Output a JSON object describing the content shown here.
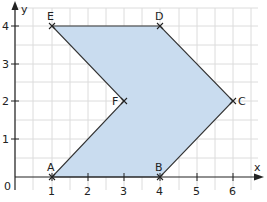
{
  "diagram": {
    "type": "coordinate-grid-polygon",
    "axes": {
      "x_label": "x",
      "y_label": "y",
      "origin_label": "0",
      "x_ticks": [
        "1",
        "2",
        "3",
        "4",
        "5",
        "6"
      ],
      "y_ticks": [
        "1",
        "2",
        "3",
        "4"
      ]
    },
    "points": [
      {
        "name": "A",
        "x": 1,
        "y": 0
      },
      {
        "name": "B",
        "x": 4,
        "y": 0
      },
      {
        "name": "C",
        "x": 6,
        "y": 2
      },
      {
        "name": "D",
        "x": 4,
        "y": 4
      },
      {
        "name": "E",
        "x": 1,
        "y": 4
      },
      {
        "name": "F",
        "x": 3,
        "y": 2
      }
    ],
    "fill_color": "#c9dcef",
    "grid_color": "#d8d8d8",
    "line_color": "#333333"
  }
}
